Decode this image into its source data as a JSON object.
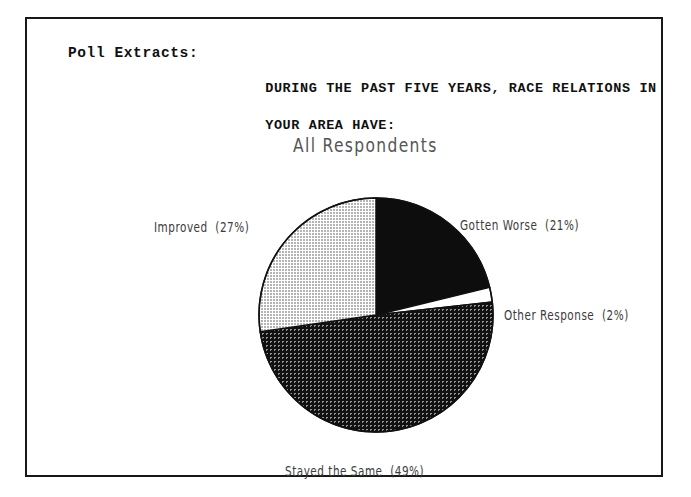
{
  "page": {
    "section_label": "Poll Extracts:",
    "question_line1": "DURING THE PAST FIVE YEARS, RACE RELATIONS IN",
    "question_line2": "YOUR AREA HAVE:"
  },
  "chart_data": {
    "type": "pie",
    "title": "All Respondents",
    "xlabel": "",
    "ylabel": "",
    "legend_position": "callout-labels",
    "grid": false,
    "start_angle_deg": 0,
    "direction": "clockwise",
    "categories": [
      "Gotten Worse",
      "Other Response",
      "Stayed the Same",
      "Improved"
    ],
    "values": [
      21,
      2,
      49,
      27
    ],
    "unit": "percent",
    "slices": [
      {
        "label": "Gotten Worse",
        "value": 21,
        "label_text": "Gotten Worse  (21%)",
        "fill": "#0d0d0d",
        "pattern": "solid-black"
      },
      {
        "label": "Other Response",
        "value": 2,
        "label_text": "Other Response  (2%)",
        "fill": "#ffffff",
        "pattern": "solid-white"
      },
      {
        "label": "Stayed the Same",
        "value": 49,
        "label_text": "Stayed the Same  (49%)",
        "fill": "#3a3a3a",
        "pattern": "dark-crosshatch"
      },
      {
        "label": "Improved",
        "value": 27,
        "label_text": "Improved  (27%)",
        "fill": "#bdbdbd",
        "pattern": "light-dither"
      }
    ],
    "colors": {
      "outline": "#111111",
      "text": "#3c3c3c",
      "title": "#555555",
      "frame": "#16181a"
    }
  }
}
